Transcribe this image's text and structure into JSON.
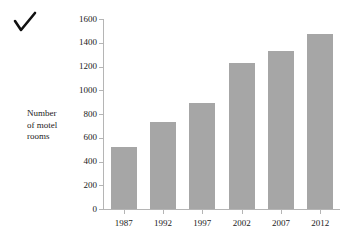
{
  "annotation": {
    "check_mark": "✓"
  },
  "chart_data": {
    "type": "bar",
    "title": "",
    "subtitle": "",
    "xlabel": "",
    "ylabel": "Number of motel rooms",
    "ylabel_lines": [
      "Number",
      "of motel",
      "rooms"
    ],
    "categories": [
      "1987",
      "1992",
      "1997",
      "2002",
      "2007",
      "2012"
    ],
    "values": [
      525,
      730,
      890,
      1230,
      1330,
      1470
    ],
    "series": [
      {
        "name": "Number of motel rooms",
        "values": [
          525,
          730,
          890,
          1230,
          1330,
          1470
        ]
      }
    ],
    "ylim": [
      0,
      1600
    ],
    "ytick_step": 200,
    "ytick_labels": [
      "0",
      "200",
      "400",
      "600",
      "800",
      "1000",
      "1200",
      "1400",
      "1600"
    ],
    "ytick_values": [
      0,
      200,
      400,
      600,
      800,
      1000,
      1200,
      1400,
      1600
    ],
    "grid": false,
    "legend": false,
    "legend_position": "none",
    "bar_color": "#a6a6a6",
    "axis_color": "#b5b5b5",
    "background_color": "#ffffff"
  }
}
